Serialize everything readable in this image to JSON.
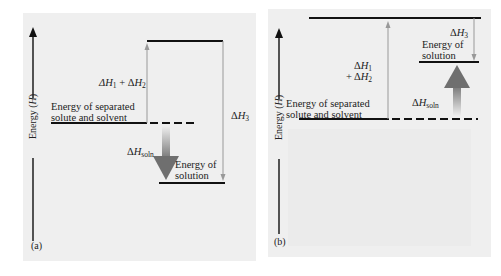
{
  "figure": {
    "panels": [
      {
        "id": "a",
        "tag": "(a)",
        "axis_label": "Energy (H)",
        "separated_label_line1": "Energy of separated",
        "separated_label_line2": "solute and solvent",
        "solution_label_line1": "Energy of",
        "solution_label_line2": "solution",
        "dh12_label": "ΔH₁ + ΔH₂",
        "dh3_label": "ΔH₃",
        "dhsoln_label": "ΔHsoln",
        "process": "exothermic"
      },
      {
        "id": "b",
        "tag": "(b)",
        "axis_label": "Energy (H)",
        "separated_label_line1": "Energy of separated",
        "separated_label_line2": "solute and solvent",
        "solution_label_line1": "Energy of",
        "solution_label_line2": "solution",
        "dh12_label_line1": "ΔH₁",
        "dh12_label_line2": "+ ΔH₂",
        "dh3_label": "ΔH₃",
        "dhsoln_label": "ΔHsoln",
        "process": "endothermic"
      }
    ],
    "colors": {
      "panel_bg": "#efefef",
      "level_line": "#111111",
      "thin_arrow": "#999999",
      "big_arrow_dark": "#777777",
      "big_arrow_light": "#efefef"
    }
  }
}
